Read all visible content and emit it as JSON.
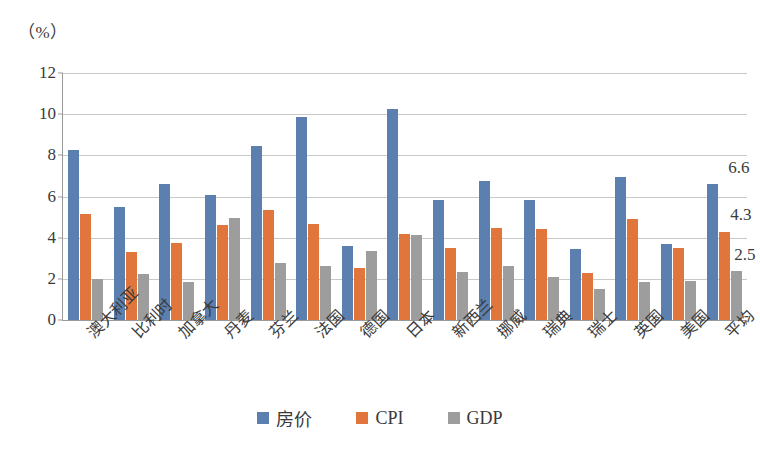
{
  "chart_data": {
    "type": "bar",
    "title": "",
    "subtitle": "",
    "xlabel": "",
    "ylabel": "（%）",
    "ylim": [
      0,
      12
    ],
    "yticks": [
      0,
      2,
      4,
      6,
      8,
      10,
      12
    ],
    "ytick_labels": [
      "0",
      "2",
      "4",
      "6",
      "8",
      "10",
      "12"
    ],
    "grid": true,
    "legend_position": "bottom",
    "categories": [
      "澳大利亚",
      "比利时",
      "加拿大",
      "丹麦",
      "芬兰",
      "法国",
      "德国",
      "日本",
      "新西兰",
      "挪威",
      "瑞典",
      "瑞士",
      "英国",
      "美国",
      "平均"
    ],
    "series": [
      {
        "name": "房价",
        "color": "#5b80b0",
        "values": [
          8.25,
          5.5,
          6.6,
          6.05,
          8.45,
          9.85,
          3.6,
          10.25,
          5.85,
          6.75,
          5.85,
          3.45,
          6.95,
          3.7,
          6.6
        ]
      },
      {
        "name": "CPI",
        "color": "#e0763c",
        "values": [
          5.15,
          3.3,
          3.75,
          4.6,
          5.35,
          4.65,
          2.55,
          4.2,
          3.5,
          4.45,
          4.4,
          2.3,
          4.9,
          3.5,
          4.3
        ]
      },
      {
        "name": "GDP",
        "color": "#9d9d9d",
        "values": [
          2.0,
          2.25,
          1.85,
          4.95,
          2.75,
          2.6,
          3.35,
          4.15,
          2.35,
          2.6,
          2.1,
          1.5,
          1.85,
          1.9,
          2.4
        ]
      }
    ],
    "annotations": [
      {
        "text": "6.6",
        "series": "房价",
        "category": "平均"
      },
      {
        "text": "4.3",
        "series": "CPI",
        "category": "平均"
      },
      {
        "text": "2.5",
        "series": "GDP",
        "category": "平均"
      }
    ]
  }
}
